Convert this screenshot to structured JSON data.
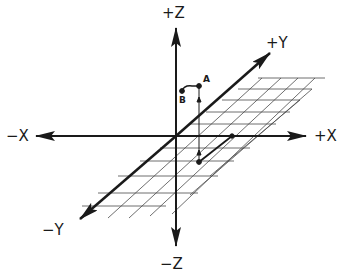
{
  "diagram": {
    "type": "3d-coordinate-axes",
    "axes": {
      "pos_z": "+Z",
      "neg_z": "−Z",
      "pos_x": "+X",
      "neg_x": "−X",
      "pos_y": "+Y",
      "neg_y": "−Y"
    },
    "points": {
      "a": "A",
      "b": "B"
    },
    "colors": {
      "line": "#1a1a1a",
      "grid": "#4a4a4a",
      "background": "#ffffff"
    }
  }
}
